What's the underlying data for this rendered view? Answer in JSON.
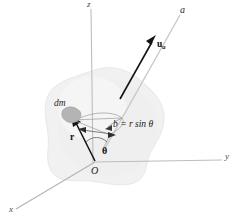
{
  "figure": {
    "background": "#ffffff",
    "width": 239,
    "height": 220
  },
  "colors": {
    "axis_gray": "#b9b9b9",
    "axis_dark": "#8f8f8f",
    "vector_dark": "#1a1a1a",
    "thin_gray": "#9a9a9a",
    "body_fill": "#f1f1f1",
    "body_stroke": "#ededed",
    "dm_fill": "#b6b6b6",
    "text": "#1a1a1a"
  },
  "labels": {
    "axis_z": "z",
    "axis_y": "y",
    "axis_x": "x",
    "axis_a": "a",
    "origin": "O",
    "mass_element": "dm",
    "position_vector": "r",
    "unit_vector": "u",
    "unit_vector_subscript": "a",
    "angle": "θ",
    "perp_distance_b": "b",
    "perp_distance_equals": "=",
    "perp_distance_expr": "r sin θ",
    "perp_distance_full": "b = r sin θ"
  },
  "geometry": {
    "origin": {
      "x": 95,
      "y": 162
    },
    "z_axis_top": {
      "x": 91,
      "y": 8
    },
    "y_axis_end": {
      "x": 224,
      "y": 160
    },
    "x_axis_end": {
      "x": 14,
      "y": 210
    },
    "a_axis_start": {
      "x": 108,
      "y": 140
    },
    "a_axis_end": {
      "x": 181,
      "y": 14
    },
    "u_arrow_tail": {
      "x": 122,
      "y": 96
    },
    "u_arrow_head": {
      "x": 156,
      "y": 38
    },
    "dm_point": {
      "x": 71,
      "y": 117
    },
    "b_foot": {
      "x": 120,
      "y": 119
    }
  },
  "elements": {
    "body_name": "rigid-body-blob",
    "mass_blob_name": "mass-element-dm",
    "angle_arc_name": "theta-angle-arc",
    "b_leader_name": "b-distance-leader"
  }
}
